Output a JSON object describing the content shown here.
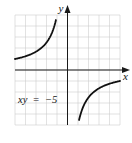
{
  "chart_data": {
    "type": "line",
    "title": "",
    "equation_label": "xy  =  −5",
    "xlabel": "x",
    "ylabel": "y",
    "xlim": [
      -5,
      5
    ],
    "ylim": [
      -5,
      5
    ],
    "grid": true,
    "series": [
      {
        "name": "xy = -5, left branch",
        "x": [
          -5,
          -4,
          -3,
          -2,
          -1.5,
          -1.1
        ],
        "y": [
          1,
          1.25,
          1.667,
          2.5,
          3.333,
          4.545
        ]
      },
      {
        "name": "xy = -5, right branch",
        "x": [
          1.1,
          1.5,
          2,
          3,
          4,
          5
        ],
        "y": [
          -4.545,
          -3.333,
          -2.5,
          -1.667,
          -1.25,
          -1
        ]
      }
    ],
    "colors": {
      "curve": "#111111",
      "grid": "#cfcfcf",
      "axis": "#1a1a1a"
    }
  }
}
